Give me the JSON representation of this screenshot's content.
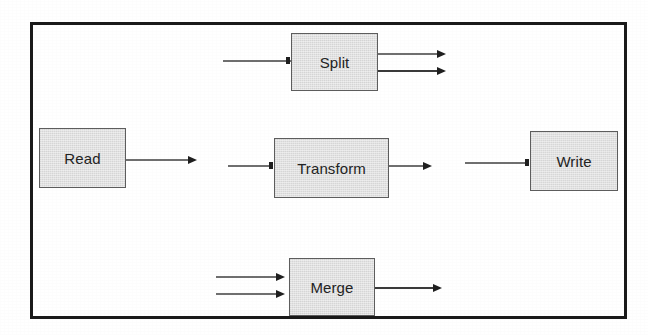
{
  "diagram": {
    "kind": "block-flow-diagram",
    "frame": {
      "border_color": "#1a1a1a"
    },
    "block_style": {
      "fill": "#e2e2e2",
      "border": "#5d5d5d",
      "text_color": "#232323"
    },
    "edge_style": {
      "color": "#3a3a3a",
      "faint_color": "#6f6f6f",
      "arrowhead_color": "#1f1f1f"
    },
    "blocks": [
      {
        "id": "split",
        "label": "Split",
        "inputs": 1,
        "outputs": 2
      },
      {
        "id": "read",
        "label": "Read",
        "inputs": 0,
        "outputs": 1
      },
      {
        "id": "transform",
        "label": "Transform",
        "inputs": 1,
        "outputs": 1
      },
      {
        "id": "write",
        "label": "Write",
        "inputs": 1,
        "outputs": 0
      },
      {
        "id": "merge",
        "label": "Merge",
        "inputs": 2,
        "outputs": 1
      }
    ],
    "edges": [
      {
        "id": "split-in",
        "target": "split",
        "role": "input"
      },
      {
        "id": "split-out-1",
        "source": "split",
        "role": "output"
      },
      {
        "id": "split-out-2",
        "source": "split",
        "role": "output"
      },
      {
        "id": "read-out",
        "source": "read",
        "role": "output"
      },
      {
        "id": "transform-in",
        "target": "transform",
        "role": "input"
      },
      {
        "id": "transform-out",
        "source": "transform",
        "role": "output"
      },
      {
        "id": "write-in",
        "target": "write",
        "role": "input"
      },
      {
        "id": "merge-in-1",
        "target": "merge",
        "role": "input"
      },
      {
        "id": "merge-in-2",
        "target": "merge",
        "role": "input"
      },
      {
        "id": "merge-out",
        "source": "merge",
        "role": "output"
      }
    ]
  }
}
